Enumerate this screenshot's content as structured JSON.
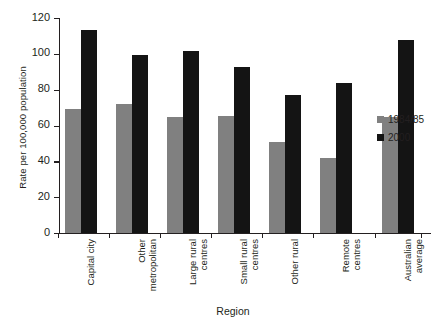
{
  "chart_data": {
    "type": "bar",
    "title": "",
    "xlabel": "Region",
    "ylabel": "Rate per 100,000 population",
    "ylim": [
      0,
      120
    ],
    "ytick_labels": [
      "0",
      "20",
      "40",
      "60",
      "80",
      "100",
      "120"
    ],
    "yticks": [
      0,
      20,
      40,
      60,
      80,
      100,
      120
    ],
    "grid": false,
    "legend_position": "right",
    "categories": [
      "Capital city",
      "Other\nmetropolitan",
      "Large rural\ncentres",
      "Small rural\ncentres",
      "Other rural",
      "Remote\ncentres",
      "Australian\naverage"
    ],
    "series": [
      {
        "name": "1984/85",
        "color": "#808080",
        "values": [
          69,
          72,
          65,
          65.5,
          51,
          42,
          65
        ]
      },
      {
        "name": "2000",
        "color": "#141414",
        "values": [
          113.5,
          99.5,
          101.5,
          92.5,
          77,
          83.5,
          108
        ]
      }
    ]
  }
}
